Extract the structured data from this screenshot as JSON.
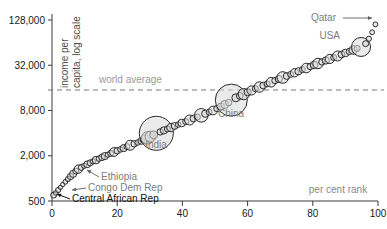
{
  "chart_data": {
    "type": "scatter",
    "title": "",
    "xlabel": "per cent rank",
    "ylabel": "income per capita, log scale",
    "ylabel_line1": "income per",
    "ylabel_line2": "capita, log scale",
    "xlim": [
      0,
      100
    ],
    "ylim": [
      500,
      128000
    ],
    "y_scale": "log",
    "grid": false,
    "legend": "none",
    "xticks": [
      0,
      20,
      40,
      60,
      80,
      100
    ],
    "xtick_labels": [
      "0",
      "20",
      "40",
      "60",
      "80",
      "100"
    ],
    "yticks": [
      500,
      2000,
      8000,
      32000,
      128000
    ],
    "ytick_labels": [
      "500",
      "2,000",
      "8,000",
      "32,000",
      "128,000"
    ],
    "reference_line": {
      "label": "world average",
      "value": 15000,
      "style": "dashed",
      "color": "#777777"
    },
    "annotations": [
      {
        "name": "qatar",
        "label": "Qatar",
        "x": 99.5,
        "y": 118000,
        "color": "#7d7d7d",
        "lx": 336,
        "ly": 21,
        "anchor": "end",
        "arrow_from": [
          343,
          18
        ],
        "arrow_to": [
          372,
          18
        ]
      },
      {
        "name": "usa",
        "label": "USA",
        "x": 95,
        "y": 52000,
        "color": "#7d7d7d",
        "lx": 340,
        "ly": 39,
        "anchor": "end",
        "arrow_from": null,
        "arrow_to": null
      },
      {
        "name": "china",
        "label": "China",
        "x": 55,
        "y": 14500,
        "color": "#7d7d7d",
        "lx": 231,
        "ly": 117,
        "anchor": "middle",
        "arrow_from": null,
        "arrow_to": null
      },
      {
        "name": "india",
        "label": "India",
        "x": 32,
        "y": 6200,
        "color": "#7d7d7d",
        "lx": 156,
        "ly": 148,
        "anchor": "middle",
        "arrow_from": null,
        "arrow_to": null
      },
      {
        "name": "ethiopia",
        "label": "Ethiopia",
        "x": 8,
        "y": 1700,
        "color": "#7d7d7d",
        "lx": 101,
        "ly": 180,
        "anchor": "start",
        "arrow_from": [
          99,
          177
        ],
        "arrow_to": [
          87,
          170
        ]
      },
      {
        "name": "congo-dem-rep",
        "label": "Congo Dem Rep",
        "x": 2,
        "y": 800,
        "color": "#7d7d7d",
        "lx": 88,
        "ly": 191,
        "anchor": "start",
        "arrow_from": [
          86,
          188
        ],
        "arrow_to": [
          72,
          190
        ]
      },
      {
        "name": "central-african-rep",
        "label": "Central African Rep",
        "x": 1,
        "y": 620,
        "color": "#111111",
        "lx": 72,
        "ly": 202,
        "anchor": "start",
        "arrow_from": [
          70,
          199
        ],
        "arrow_to": [
          57,
          194
        ]
      }
    ],
    "points": [
      {
        "x": 0.5,
        "y": 600,
        "r": 3.0
      },
      {
        "x": 1.2,
        "y": 640,
        "r": 2.4
      },
      {
        "x": 1.9,
        "y": 700,
        "r": 2.6
      },
      {
        "x": 2.6,
        "y": 760,
        "r": 2.2
      },
      {
        "x": 3.3,
        "y": 830,
        "r": 2.2
      },
      {
        "x": 4.1,
        "y": 900,
        "r": 2.4
      },
      {
        "x": 4.9,
        "y": 980,
        "r": 2.6
      },
      {
        "x": 5.7,
        "y": 1060,
        "r": 3.2
      },
      {
        "x": 6.5,
        "y": 1150,
        "r": 3.6
      },
      {
        "x": 7.3,
        "y": 1250,
        "r": 3.0
      },
      {
        "x": 8.1,
        "y": 1330,
        "r": 4.2
      },
      {
        "x": 9.0,
        "y": 1400,
        "r": 3.0
      },
      {
        "x": 9.9,
        "y": 1470,
        "r": 2.6
      },
      {
        "x": 10.8,
        "y": 1540,
        "r": 3.4
      },
      {
        "x": 11.7,
        "y": 1610,
        "r": 3.0
      },
      {
        "x": 12.6,
        "y": 1680,
        "r": 2.6
      },
      {
        "x": 13.5,
        "y": 1750,
        "r": 3.8
      },
      {
        "x": 14.4,
        "y": 1830,
        "r": 2.8
      },
      {
        "x": 15.3,
        "y": 1900,
        "r": 3.2
      },
      {
        "x": 16.2,
        "y": 1980,
        "r": 3.6
      },
      {
        "x": 17.1,
        "y": 2060,
        "r": 2.6
      },
      {
        "x": 18.0,
        "y": 2150,
        "r": 3.0
      },
      {
        "x": 19.0,
        "y": 2240,
        "r": 4.4
      },
      {
        "x": 20.0,
        "y": 2330,
        "r": 3.2
      },
      {
        "x": 21.0,
        "y": 2430,
        "r": 2.8
      },
      {
        "x": 22.0,
        "y": 2530,
        "r": 3.6
      },
      {
        "x": 23.0,
        "y": 2650,
        "r": 3.0
      },
      {
        "x": 24.0,
        "y": 2760,
        "r": 5.0
      },
      {
        "x": 25.2,
        "y": 2880,
        "r": 3.2
      },
      {
        "x": 26.3,
        "y": 3000,
        "r": 2.8
      },
      {
        "x": 27.4,
        "y": 3150,
        "r": 3.4
      },
      {
        "x": 28.5,
        "y": 3300,
        "r": 4.6
      },
      {
        "x": 29.3,
        "y": 3450,
        "r": 6.2
      },
      {
        "x": 30.2,
        "y": 3600,
        "r": 5.4
      },
      {
        "x": 31.2,
        "y": 3800,
        "r": 4.0
      },
      {
        "x": 32.0,
        "y": 3980,
        "r": 17.0
      },
      {
        "x": 33.2,
        "y": 4150,
        "r": 3.2
      },
      {
        "x": 34.3,
        "y": 4350,
        "r": 3.6
      },
      {
        "x": 35.4,
        "y": 4550,
        "r": 3.0
      },
      {
        "x": 36.5,
        "y": 4750,
        "r": 4.2
      },
      {
        "x": 37.6,
        "y": 4980,
        "r": 3.4
      },
      {
        "x": 38.7,
        "y": 5200,
        "r": 2.8
      },
      {
        "x": 39.8,
        "y": 5450,
        "r": 3.8
      },
      {
        "x": 41.0,
        "y": 5700,
        "r": 3.0
      },
      {
        "x": 42.2,
        "y": 5980,
        "r": 5.0
      },
      {
        "x": 43.4,
        "y": 6250,
        "r": 3.4
      },
      {
        "x": 44.6,
        "y": 6550,
        "r": 3.0
      },
      {
        "x": 45.8,
        "y": 6900,
        "r": 6.8
      },
      {
        "x": 47.0,
        "y": 7250,
        "r": 3.6
      },
      {
        "x": 48.2,
        "y": 7600,
        "r": 3.0
      },
      {
        "x": 49.4,
        "y": 8000,
        "r": 4.4
      },
      {
        "x": 50.6,
        "y": 8500,
        "r": 3.2
      },
      {
        "x": 51.8,
        "y": 9000,
        "r": 3.6
      },
      {
        "x": 53.0,
        "y": 9600,
        "r": 4.0
      },
      {
        "x": 54.2,
        "y": 10200,
        "r": 3.2
      },
      {
        "x": 55.0,
        "y": 11000,
        "r": 16.0
      },
      {
        "x": 56.4,
        "y": 11800,
        "r": 4.0
      },
      {
        "x": 57.6,
        "y": 12500,
        "r": 3.4
      },
      {
        "x": 58.8,
        "y": 13200,
        "r": 5.6
      },
      {
        "x": 60.0,
        "y": 14000,
        "r": 3.6
      },
      {
        "x": 61.2,
        "y": 14800,
        "r": 4.6
      },
      {
        "x": 62.4,
        "y": 15600,
        "r": 3.0
      },
      {
        "x": 63.6,
        "y": 16400,
        "r": 5.2
      },
      {
        "x": 64.8,
        "y": 17200,
        "r": 3.4
      },
      {
        "x": 66.0,
        "y": 18100,
        "r": 3.0
      },
      {
        "x": 67.2,
        "y": 19000,
        "r": 4.8
      },
      {
        "x": 68.4,
        "y": 20000,
        "r": 3.2
      },
      {
        "x": 69.6,
        "y": 21000,
        "r": 3.6
      },
      {
        "x": 70.8,
        "y": 22000,
        "r": 5.8
      },
      {
        "x": 72.0,
        "y": 23000,
        "r": 3.4
      },
      {
        "x": 73.2,
        "y": 24200,
        "r": 3.0
      },
      {
        "x": 74.4,
        "y": 25400,
        "r": 4.2
      },
      {
        "x": 75.6,
        "y": 26600,
        "r": 3.6
      },
      {
        "x": 76.8,
        "y": 28000,
        "r": 3.0
      },
      {
        "x": 78.0,
        "y": 29400,
        "r": 4.8
      },
      {
        "x": 79.2,
        "y": 30800,
        "r": 3.2
      },
      {
        "x": 80.4,
        "y": 32300,
        "r": 3.8
      },
      {
        "x": 81.6,
        "y": 33800,
        "r": 5.2
      },
      {
        "x": 82.8,
        "y": 35400,
        "r": 3.2
      },
      {
        "x": 84.0,
        "y": 37000,
        "r": 3.6
      },
      {
        "x": 85.2,
        "y": 38800,
        "r": 4.6
      },
      {
        "x": 86.4,
        "y": 40600,
        "r": 3.0
      },
      {
        "x": 87.6,
        "y": 42500,
        "r": 5.0
      },
      {
        "x": 88.8,
        "y": 44500,
        "r": 3.4
      },
      {
        "x": 90.0,
        "y": 46600,
        "r": 3.8
      },
      {
        "x": 91.2,
        "y": 48800,
        "r": 3.2
      },
      {
        "x": 92.4,
        "y": 51000,
        "r": 4.2
      },
      {
        "x": 93.6,
        "y": 53500,
        "r": 3.0
      },
      {
        "x": 94.8,
        "y": 56000,
        "r": 9.5
      },
      {
        "x": 96.2,
        "y": 62000,
        "r": 3.0
      },
      {
        "x": 97.2,
        "y": 72000,
        "r": 2.6
      },
      {
        "x": 98.2,
        "y": 88000,
        "r": 2.4
      },
      {
        "x": 99.2,
        "y": 112000,
        "r": 2.4
      }
    ]
  }
}
